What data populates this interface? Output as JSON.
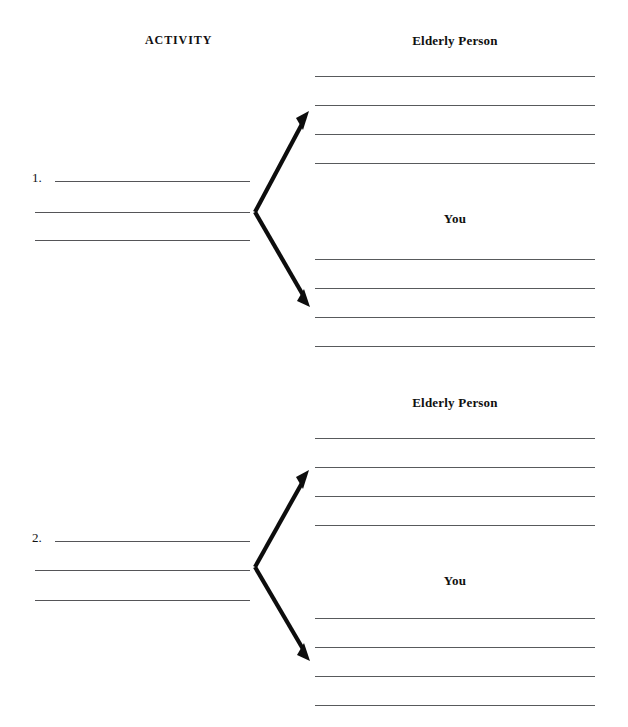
{
  "document": {
    "type": "worksheet",
    "background_color": "#ffffff",
    "rule_color": "#58585a",
    "ink_color": "#0d0d0d",
    "width": 628,
    "height": 727
  },
  "headers": {
    "activity_label": "ACTIVITY",
    "elderly_person_label": "Elderly Person",
    "you_label": "You"
  },
  "sections": [
    {
      "number_label": "1.",
      "elderly_person_heading": "Elderly Person",
      "you_heading": "You",
      "activity_rules": [
        {
          "x": 55,
          "y": 181,
          "width": 195
        },
        {
          "x": 35,
          "y": 212,
          "width": 215
        },
        {
          "x": 35,
          "y": 240,
          "width": 215
        }
      ],
      "elderly_rules": [
        {
          "x": 315,
          "y": 76,
          "width": 280
        },
        {
          "x": 315,
          "y": 105,
          "width": 280
        },
        {
          "x": 315,
          "y": 134,
          "width": 280
        },
        {
          "x": 315,
          "y": 163,
          "width": 280
        }
      ],
      "you_rules": [
        {
          "x": 315,
          "y": 259,
          "width": 280
        },
        {
          "x": 315,
          "y": 288,
          "width": 280
        },
        {
          "x": 315,
          "y": 317,
          "width": 280
        },
        {
          "x": 315,
          "y": 346,
          "width": 280
        }
      ],
      "fork": {
        "vertex_x": 255,
        "vertex_y": 212,
        "up_tip_x": 309,
        "up_tip_y": 111,
        "down_tip_x": 310,
        "down_tip_y": 307
      },
      "elderly_heading_pos": {
        "x": 455,
        "y": 33
      },
      "you_heading_pos": {
        "x": 455,
        "y": 211
      },
      "number_pos": {
        "x": 32,
        "y": 170
      }
    },
    {
      "number_label": "2.",
      "elderly_person_heading": "Elderly Person",
      "you_heading": "You",
      "activity_rules": [
        {
          "x": 55,
          "y": 541,
          "width": 195
        },
        {
          "x": 35,
          "y": 570,
          "width": 215
        },
        {
          "x": 35,
          "y": 600,
          "width": 215
        }
      ],
      "elderly_rules": [
        {
          "x": 315,
          "y": 438,
          "width": 280
        },
        {
          "x": 315,
          "y": 467,
          "width": 280
        },
        {
          "x": 315,
          "y": 496,
          "width": 280
        },
        {
          "x": 315,
          "y": 525,
          "width": 280
        }
      ],
      "you_rules": [
        {
          "x": 315,
          "y": 618,
          "width": 280
        },
        {
          "x": 315,
          "y": 647,
          "width": 280
        },
        {
          "x": 315,
          "y": 676,
          "width": 280
        },
        {
          "x": 315,
          "y": 705,
          "width": 280
        }
      ],
      "fork": {
        "vertex_x": 255,
        "vertex_y": 567,
        "up_tip_x": 309,
        "up_tip_y": 470,
        "down_tip_x": 310,
        "down_tip_y": 661
      },
      "elderly_heading_pos": {
        "x": 455,
        "y": 395
      },
      "you_heading_pos": {
        "x": 455,
        "y": 573
      },
      "number_pos": {
        "x": 32,
        "y": 530
      }
    }
  ],
  "activity_heading_pos": {
    "x": 145,
    "y": 33
  }
}
